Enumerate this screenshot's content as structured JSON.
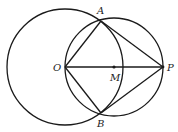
{
  "diagram": {
    "type": "geometry",
    "points": {
      "A": {
        "label": "A",
        "x": 101,
        "y": 22
      },
      "B": {
        "label": "B",
        "x": 101,
        "y": 113
      },
      "O": {
        "label": "O",
        "x": 65,
        "y": 67
      },
      "M": {
        "label": "M",
        "x": 114,
        "y": 67
      },
      "P": {
        "label": "P",
        "x": 163,
        "y": 67
      }
    },
    "circles": [
      {
        "name": "circle-O",
        "center": "O",
        "r": 58
      },
      {
        "name": "circle-M",
        "center": "M",
        "r": 49
      }
    ],
    "segments": [
      [
        "O",
        "A"
      ],
      [
        "O",
        "B"
      ],
      [
        "P",
        "A"
      ],
      [
        "P",
        "B"
      ],
      [
        "O",
        "P"
      ]
    ],
    "stroke_color": "#1a1a1a"
  }
}
